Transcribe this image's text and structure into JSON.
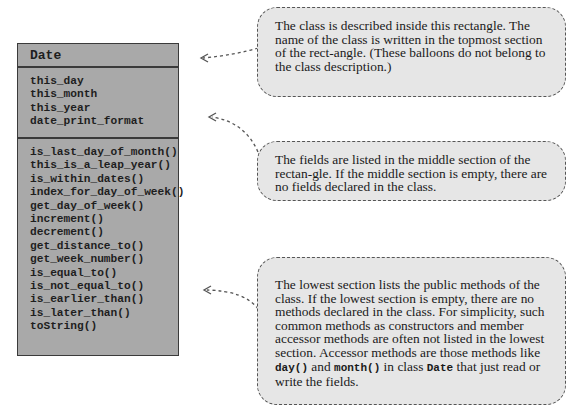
{
  "class_diagram": {
    "class_name": "Date",
    "fields": [
      "this_day",
      "this_month",
      "this_year",
      "date_print_format"
    ],
    "methods": [
      "is_last_day_of_month()",
      "this_is_a_leap_year()",
      "is_within_dates()",
      "index_for_day_of_week()",
      "get_day_of_week()",
      "increment()",
      "decrement()",
      "get_distance_to()",
      "get_week_number()",
      "is_equal_to()",
      "is_not_equal_to()",
      "is_earlier_than()",
      "is_later_than()",
      "toString()"
    ]
  },
  "balloons": {
    "class_name_note": "The class is described inside this rectangle. The name of the class is written in the topmost section of the rect-angle. (These balloons do not belong to the class description.)",
    "fields_note": "The fields are listed in the middle section of the rectan-gle. If the middle section is empty, there are no fields declared in the class.",
    "methods_note": {
      "text_1": "The lowest section lists the public methods of the class. If the lowest section is empty, there are no methods declared in the class. For simplicity, such common methods as constructors and member accessor methods are often not listed in the lowest section. Accessor methods are those methods like ",
      "code_1": "day()",
      "text_2": " and ",
      "code_2": "month()",
      "text_3": " in class ",
      "code_3": "Date",
      "text_4": " that just read or write the fields."
    }
  },
  "colors": {
    "class_fill": "#a9a9a9",
    "class_border": "#3a3a3a",
    "balloon_fill": "#e6e6e6",
    "balloon_border": "#555555"
  }
}
